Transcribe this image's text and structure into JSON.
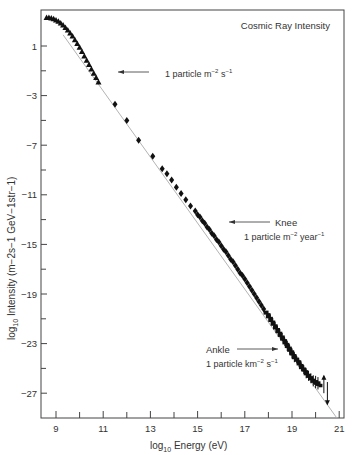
{
  "chart_data": {
    "type": "scatter",
    "title": "Cosmic Ray Intensity",
    "xlabel": "log10 Energy (eV)",
    "ylabel": "log10 Intensity (m^-2 s^-1 GeV^-1 str^-1)",
    "xlim": [
      8.4,
      21
    ],
    "ylim": [
      -29.1,
      3.8
    ],
    "x_ticks_major": [
      9,
      11,
      13,
      15,
      17,
      19,
      21
    ],
    "x_ticks_minor": [
      10,
      12,
      14,
      16,
      18,
      20
    ],
    "y_ticks_major": [
      1,
      -3,
      -7,
      -11,
      -15,
      -19,
      -23,
      -27
    ],
    "y_ticks_minor": [
      -1,
      -5,
      -9,
      -13,
      -17,
      -21,
      -25
    ],
    "grid": false,
    "reference_line": {
      "x": [
        9.3,
        20.9
      ],
      "y": [
        1.9,
        -29.0
      ],
      "color": "#aaaaaa"
    },
    "series": [
      {
        "name": "low-energy (triangles)",
        "marker": "triangle",
        "x": [
          8.6,
          8.7,
          8.8,
          8.9,
          9.0,
          9.1,
          9.2,
          9.3,
          9.4,
          9.5,
          9.6,
          9.7,
          9.8,
          9.9,
          10.0,
          10.1,
          10.2,
          10.3,
          10.4,
          10.5,
          10.6,
          10.7,
          10.8
        ],
        "y": [
          3.3,
          3.3,
          3.25,
          3.2,
          3.1,
          3.0,
          2.85,
          2.7,
          2.5,
          2.3,
          2.05,
          1.8,
          1.5,
          1.2,
          0.9,
          0.55,
          0.2,
          -0.15,
          -0.5,
          -0.85,
          -1.2,
          -1.55,
          -1.9
        ]
      },
      {
        "name": "mid-energy (diamonds)",
        "marker": "diamond",
        "x": [
          11.5,
          12.0,
          12.5,
          13.1,
          13.5,
          13.7,
          13.9,
          14.1,
          14.3,
          14.5,
          14.7,
          14.9,
          15.0,
          15.1,
          15.2,
          15.3,
          15.4,
          15.5,
          15.6,
          15.7,
          15.8,
          15.9,
          16.0,
          16.1,
          16.2,
          16.3,
          16.4,
          16.5,
          16.6,
          16.7,
          16.8,
          16.9,
          17.0,
          17.1,
          17.2,
          17.3,
          17.4,
          17.5,
          17.6,
          17.7,
          17.8
        ],
        "y": [
          -3.7,
          -5.0,
          -6.6,
          -7.9,
          -8.9,
          -9.3,
          -9.8,
          -10.4,
          -10.9,
          -11.4,
          -11.9,
          -12.3,
          -12.6,
          -12.8,
          -13.1,
          -13.3,
          -13.6,
          -13.8,
          -14.1,
          -14.3,
          -14.6,
          -14.8,
          -15.1,
          -15.4,
          -15.6,
          -15.9,
          -16.2,
          -16.4,
          -16.7,
          -17.0,
          -17.3,
          -17.5,
          -17.8,
          -18.1,
          -18.4,
          -18.7,
          -19.0,
          -19.3,
          -19.6,
          -19.9,
          -20.2
        ]
      },
      {
        "name": "high-energy (dense with error bars)",
        "marker": "dot",
        "x": [
          17.9,
          18.0,
          18.1,
          18.2,
          18.3,
          18.4,
          18.5,
          18.6,
          18.7,
          18.8,
          18.9,
          19.0,
          19.1,
          19.2,
          19.3,
          19.4,
          19.5,
          19.6,
          19.7,
          19.8,
          19.9,
          20.0,
          20.1
        ],
        "y": [
          -20.5,
          -20.8,
          -21.1,
          -21.4,
          -21.7,
          -22.0,
          -22.3,
          -22.6,
          -22.9,
          -23.2,
          -23.5,
          -23.8,
          -24.1,
          -24.3,
          -24.6,
          -24.9,
          -25.1,
          -25.4,
          -25.6,
          -25.8,
          -26.0,
          -26.1,
          -26.2
        ],
        "err": [
          0.1,
          0.1,
          0.1,
          0.1,
          0.15,
          0.15,
          0.2,
          0.2,
          0.3,
          0.4,
          0.4,
          0.4,
          0.4,
          0.3,
          0.3,
          0.3,
          0.35,
          0.4,
          0.4,
          0.4,
          0.45,
          0.5,
          0.5
        ]
      },
      {
        "name": "highest-energy limits",
        "marker": "arrow",
        "x": [
          20.35,
          20.5
        ],
        "y": [
          -26.3,
          -27.0
        ],
        "err": [
          0.7,
          0.9
        ]
      }
    ],
    "annotations": [
      {
        "text": "1 particle  m⁻² s⁻¹",
        "arrow_to": [
          11.3,
          -1.75
        ],
        "pos": [
          12.3,
          -1.75
        ]
      },
      {
        "label": "Knee",
        "text": "1 particle  m⁻² year⁻¹",
        "arrow_to": [
          16.1,
          -15.2
        ],
        "pos": [
          17.6,
          -15.2
        ]
      },
      {
        "label": "Ankle",
        "text": "1 particle  km⁻² s⁻¹",
        "arrow_to": [
          18.65,
          -23.2
        ],
        "pos": [
          16.6,
          -23.2
        ]
      }
    ]
  },
  "labels": {
    "title": "Cosmic Ray Intensity",
    "xlabel_prefix": "log",
    "xlabel_sub": "10",
    "xlabel_suffix": " Energy (eV)",
    "ylabel_prefix": "log",
    "ylabel_sub": "10",
    "ylabel_suffix": " Intensity  (m−2s−1 GeV−1str−1)",
    "ann1": "1 particle  m",
    "ann1_sup1": "−2",
    "ann1_mid": " s",
    "ann1_sup2": "−1",
    "knee": "Knee",
    "knee_text": "1 particle  m",
    "knee_sup1": "−2",
    "knee_mid": " year",
    "knee_sup2": "−1",
    "ankle": "Ankle",
    "ankle_text": "1 particle  km",
    "ankle_sup1": "−2",
    "ankle_mid": " s",
    "ankle_sup2": "−1"
  }
}
